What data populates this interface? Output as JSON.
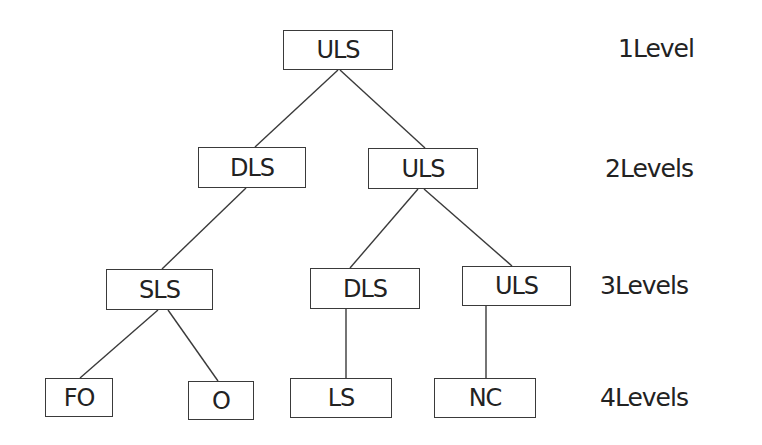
{
  "diagram": {
    "type": "tree",
    "colors": {
      "line": "#3a3a3a",
      "text": "#222222",
      "background": "#ffffff"
    },
    "nodes": [
      {
        "id": "n1",
        "label": "ULS",
        "level": 1,
        "parent": null
      },
      {
        "id": "n2",
        "label": "DLS",
        "level": 2,
        "parent": "n1"
      },
      {
        "id": "n3",
        "label": "ULS",
        "level": 2,
        "parent": "n1"
      },
      {
        "id": "n4",
        "label": "SLS",
        "level": 3,
        "parent": "n2"
      },
      {
        "id": "n5",
        "label": "DLS",
        "level": 3,
        "parent": "n3"
      },
      {
        "id": "n6",
        "label": "ULS",
        "level": 3,
        "parent": "n3"
      },
      {
        "id": "n7",
        "label": "FO",
        "level": 4,
        "parent": "n4"
      },
      {
        "id": "n8",
        "label": "O",
        "level": 4,
        "parent": "n4"
      },
      {
        "id": "n9",
        "label": "LS",
        "level": 4,
        "parent": "n5"
      },
      {
        "id": "n10",
        "label": "NC",
        "level": 4,
        "parent": "n6"
      }
    ],
    "level_labels": [
      {
        "level": 1,
        "text": "1Level"
      },
      {
        "level": 2,
        "text": "2Levels"
      },
      {
        "level": 3,
        "text": "3Levels"
      },
      {
        "level": 4,
        "text": "4Levels"
      }
    ]
  }
}
